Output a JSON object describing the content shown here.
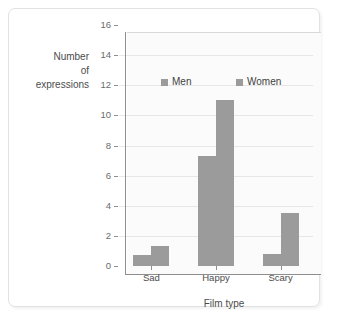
{
  "chart_data": {
    "type": "bar",
    "title": "",
    "xlabel": "Film type",
    "ylabel_lines": [
      "Number",
      "of",
      "expressions"
    ],
    "ylabel": "Number of expressions",
    "categories": [
      "Sad",
      "Happy",
      "Scary"
    ],
    "series": [
      {
        "name": "Men",
        "values": [
          0.7,
          7.3,
          0.8
        ],
        "color": "#9b9b9b"
      },
      {
        "name": "Women",
        "values": [
          1.3,
          11,
          3.5
        ],
        "color": "#9b9b9b"
      }
    ],
    "ylim": [
      0,
      16
    ],
    "ytick_step": 2,
    "yticks": [
      0,
      2,
      4,
      6,
      8,
      10,
      12,
      14,
      16
    ],
    "ytick_labels": [
      "0",
      "2",
      "4",
      "6",
      "8",
      "10",
      "12",
      "14",
      "16"
    ],
    "grid": true,
    "grid_axis": "y",
    "legend": [
      "Men",
      "Women"
    ],
    "legend_position": "inside-upper-left",
    "plot_background": "#fbfbfb",
    "gridline_color": "#e6e6e6",
    "axis_color": "#8e8e8e",
    "frame_border_color": "#e2e2e2"
  }
}
